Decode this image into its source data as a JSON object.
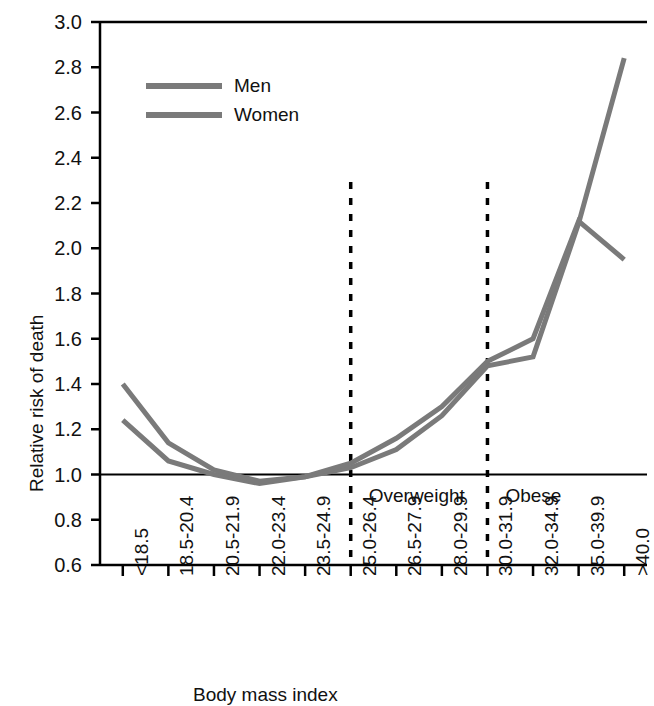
{
  "chart_data": {
    "type": "line",
    "title": "",
    "xlabel": "Body mass index",
    "ylabel": "Relative risk of death",
    "categories": [
      "<18.5",
      "18.5-20.4",
      "20.5-21.9",
      "22.0-23.4",
      "23.5-24.9",
      "25.0-26.4",
      "26.5-27.9",
      "28.0-29.9",
      "30.0-31.9",
      "32.0-34.9",
      "35.0-39.9",
      ">40.0"
    ],
    "series": [
      {
        "name": "Men",
        "color": "#7a7a7a",
        "values": [
          1.24,
          1.06,
          1.0,
          0.96,
          0.99,
          1.03,
          1.11,
          1.26,
          1.48,
          1.52,
          2.11,
          2.84
        ]
      },
      {
        "name": "Women",
        "color": "#7a7a7a",
        "values": [
          1.4,
          1.14,
          1.02,
          0.97,
          0.99,
          1.05,
          1.16,
          1.3,
          1.5,
          1.6,
          2.12,
          1.95
        ]
      }
    ],
    "ylim": [
      0.6,
      3.0
    ],
    "yticks": [
      "0.6",
      "0.8",
      "1.0",
      "1.2",
      "1.4",
      "1.6",
      "1.8",
      "2.0",
      "2.2",
      "2.4",
      "2.6",
      "2.8",
      "3.0"
    ],
    "ytick_values": [
      0.6,
      0.8,
      1.0,
      1.2,
      1.4,
      1.6,
      1.8,
      2.0,
      2.2,
      2.4,
      2.6,
      2.8,
      3.0
    ],
    "reference_line": {
      "value": 1.0,
      "color": "#000000"
    },
    "annotations": [
      {
        "label": "Overweight",
        "after_category_index": 5
      },
      {
        "label": "Obese",
        "after_category_index": 8
      }
    ],
    "dividers": [
      5,
      8
    ],
    "grid": false,
    "legend_position": "top-left",
    "legend": [
      "Men",
      "Women"
    ]
  },
  "axis_line_color": "#000000",
  "line_width": 5
}
